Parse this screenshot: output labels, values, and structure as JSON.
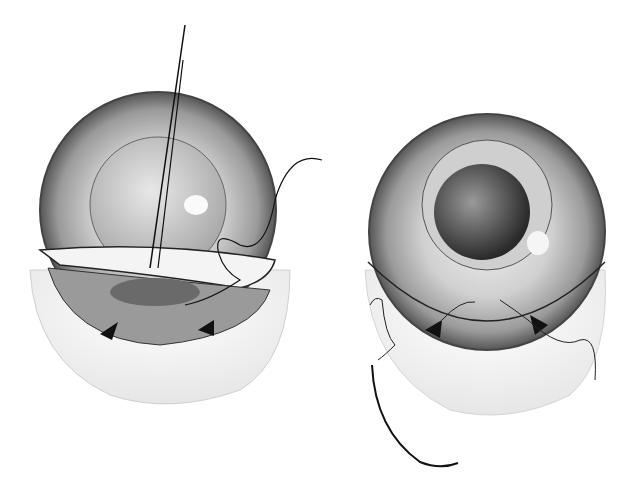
{
  "figure": {
    "panels": [
      {
        "id": "left",
        "subject": "eye-with-scleral-flap-and-needle"
      },
      {
        "id": "right",
        "subject": "eye-with-sutured-flap-and-curved-needle"
      }
    ],
    "colors": {
      "background": "#ffffff",
      "line": "#111111",
      "shade": "#8a8a8a",
      "light": "#d9d9d9"
    }
  }
}
